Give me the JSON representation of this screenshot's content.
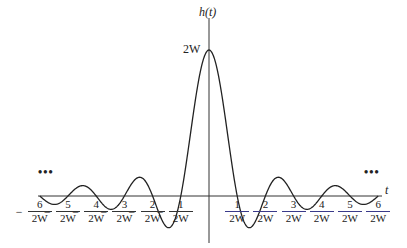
{
  "chart_data": {
    "type": "line",
    "title": "",
    "function": "h(t) = 2W sinc(2Wt)",
    "xlabel": "t",
    "ylabel": "h(t)",
    "peak_label": "2W",
    "x_ticks": [
      "-6/2W",
      "-5/2W",
      "-4/2W",
      "-3/2W",
      "-2/2W",
      "-1/2W",
      "1/2W",
      "2/2W",
      "3/2W",
      "4/2W",
      "5/2W",
      "6/2W"
    ],
    "x_tick_values": [
      -6,
      -5,
      -4,
      -3,
      -2,
      -1,
      1,
      2,
      3,
      4,
      5,
      6
    ],
    "x_unit": "1/2W",
    "zeros": [
      -6,
      -5,
      -4,
      -3,
      -2,
      -1,
      1,
      2,
      3,
      4,
      5,
      6
    ],
    "peak": {
      "x": 0,
      "y": "2W"
    },
    "continuation": "...",
    "grid": false
  },
  "labels": {
    "y_axis": "h(t)",
    "x_axis": "t",
    "peak": "2W",
    "ellipsis_left": "•••",
    "ellipsis_right": "•••",
    "ticks_neg": [
      {
        "num": "6",
        "den": "2W"
      },
      {
        "num": "5",
        "den": "2W"
      },
      {
        "num": "4",
        "den": "2W"
      },
      {
        "num": "3",
        "den": "2W"
      },
      {
        "num": "2",
        "den": "2W"
      },
      {
        "num": "1",
        "den": "2W"
      }
    ],
    "ticks_pos": [
      {
        "num": "1",
        "den": "2W"
      },
      {
        "num": "2",
        "den": "2W"
      },
      {
        "num": "3",
        "den": "2W"
      },
      {
        "num": "4",
        "den": "2W"
      },
      {
        "num": "5",
        "den": "2W"
      },
      {
        "num": "6",
        "den": "2W"
      }
    ],
    "minus": "−"
  }
}
